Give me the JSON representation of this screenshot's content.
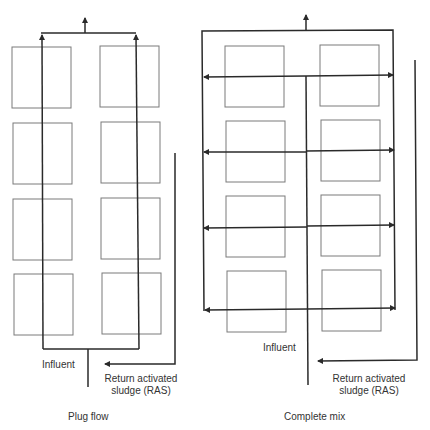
{
  "colors": {
    "line": "#2a2a2a",
    "box": "#7a7a7a",
    "text": "#333333",
    "background": "#ffffff"
  },
  "plug_flow": {
    "title": "Plug flow",
    "influent_label": "Influent",
    "ras_label_line1": "Return activated",
    "ras_label_line2": "sludge (RAS)",
    "tanks": {
      "rows": 4,
      "columns": 2
    }
  },
  "complete_mix": {
    "title": "Complete mix",
    "influent_label": "Influent",
    "ras_label_line1": "Return activated",
    "ras_label_line2": "sludge (RAS)",
    "tanks": {
      "rows": 4,
      "columns": 2
    },
    "distribution_arrows": 4
  }
}
